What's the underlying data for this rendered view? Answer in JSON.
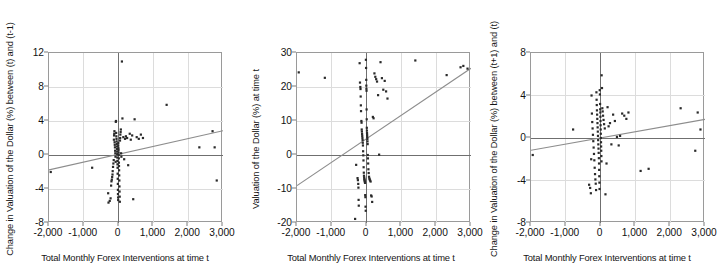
{
  "figure": {
    "width": 726,
    "height": 278,
    "background": "#ffffff",
    "axis_color": "#9a9a9a",
    "grid_color": "#dcdcdc",
    "point_color": "#2a2a2a",
    "trend_color": "#8d8d8d",
    "zero_line_color": "#6f6f6f"
  },
  "chart_data": [
    {
      "type": "scatter",
      "title": "",
      "xlabel": "Total Monthly Forex Interventions at time t",
      "ylabel": "Change in Valuation of the Dollar (%) between (t) and (t-1)",
      "xlim": [
        -2000,
        3000
      ],
      "ylim": [
        -8,
        12
      ],
      "xticks": [
        -2000,
        -1000,
        0,
        1000,
        2000,
        3000
      ],
      "xticklabels": [
        "-2,000",
        "-1,000",
        "0",
        "1,000",
        "2,000",
        "3,000"
      ],
      "yticks": [
        -8,
        -4,
        0,
        4,
        8,
        12
      ],
      "yticklabels": [
        "-8",
        "-4",
        "0",
        "4",
        "8",
        "12"
      ],
      "grid": true,
      "legend": "none",
      "trendline": {
        "x0": -2000,
        "y0": -1.75,
        "x1": 3000,
        "y1": 2.85
      },
      "zero_line_y": 0,
      "zero_line_x": 0,
      "points": [
        [
          -1950,
          -2.0
        ],
        [
          -760,
          -1.5
        ],
        [
          -300,
          -4.5
        ],
        [
          -290,
          -5.6
        ],
        [
          -255,
          -5.4
        ],
        [
          -230,
          -5.1
        ],
        [
          -215,
          -3.6
        ],
        [
          -205,
          -3.1
        ],
        [
          -195,
          -2.9
        ],
        [
          -185,
          -2.6
        ],
        [
          -175,
          -2.3
        ],
        [
          -170,
          -1.9
        ],
        [
          -160,
          -1.4
        ],
        [
          -150,
          -1.0
        ],
        [
          -140,
          -0.6
        ],
        [
          -135,
          1.8
        ],
        [
          -130,
          2.3
        ],
        [
          -125,
          2.5
        ],
        [
          -120,
          2.8
        ],
        [
          -115,
          1.5
        ],
        [
          -110,
          1.2
        ],
        [
          -105,
          0.9
        ],
        [
          -100,
          0.5
        ],
        [
          -95,
          0.2
        ],
        [
          -90,
          -0.2
        ],
        [
          -85,
          -0.8
        ],
        [
          -80,
          3.9
        ],
        [
          -75,
          4.0
        ],
        [
          -70,
          2.6
        ],
        [
          -65,
          2.2
        ],
        [
          -60,
          1.9
        ],
        [
          -55,
          1.6
        ],
        [
          -52,
          1.3
        ],
        [
          -48,
          1.0
        ],
        [
          -45,
          0.7
        ],
        [
          -42,
          0.4
        ],
        [
          -40,
          0.1
        ],
        [
          -38,
          -0.3
        ],
        [
          -35,
          -0.7
        ],
        [
          -32,
          -1.1
        ],
        [
          -30,
          -1.5
        ],
        [
          -28,
          -2.2
        ],
        [
          -25,
          -2.8
        ],
        [
          -22,
          -3.4
        ],
        [
          -20,
          -4.1
        ],
        [
          -18,
          -4.6
        ],
        [
          -15,
          -5.0
        ],
        [
          -12,
          -5.3
        ],
        [
          -10,
          1.1
        ],
        [
          -8,
          1.4
        ],
        [
          -5,
          0.8
        ],
        [
          -2,
          0.6
        ],
        [
          0,
          0.3
        ],
        [
          3,
          0.0
        ],
        [
          6,
          -0.4
        ],
        [
          9,
          -0.9
        ],
        [
          12,
          -1.3
        ],
        [
          15,
          -1.8
        ],
        [
          18,
          -2.4
        ],
        [
          22,
          -3.0
        ],
        [
          25,
          -3.7
        ],
        [
          28,
          -4.3
        ],
        [
          32,
          -4.9
        ],
        [
          36,
          -5.5
        ],
        [
          40,
          1.7
        ],
        [
          45,
          2.0
        ],
        [
          50,
          2.4
        ],
        [
          58,
          2.7
        ],
        [
          65,
          3.0
        ],
        [
          72,
          0.2
        ],
        [
          80,
          -0.2
        ],
        [
          95,
          11.0
        ],
        [
          110,
          4.3
        ],
        [
          135,
          2.1
        ],
        [
          160,
          -0.5
        ],
        [
          185,
          1.9
        ],
        [
          210,
          2.2
        ],
        [
          245,
          2.0
        ],
        [
          275,
          -1.2
        ],
        [
          320,
          2.5
        ],
        [
          350,
          1.8
        ],
        [
          390,
          2.3
        ],
        [
          420,
          -5.2
        ],
        [
          460,
          4.2
        ],
        [
          520,
          2.1
        ],
        [
          580,
          1.9
        ],
        [
          640,
          2.4
        ],
        [
          700,
          2.0
        ],
        [
          1380,
          5.9
        ],
        [
          2320,
          0.9
        ],
        [
          2700,
          2.8
        ],
        [
          2760,
          0.9
        ],
        [
          2820,
          -3.0
        ]
      ]
    },
    {
      "type": "scatter",
      "title": "",
      "xlabel": "Total Monthly Forex Interventions at time t",
      "ylabel": "Valuation of the Dollar (%) at time t",
      "xlim": [
        -2000,
        3000
      ],
      "ylim": [
        -20,
        30
      ],
      "xticks": [
        -2000,
        -1000,
        0,
        1000,
        2000,
        3000
      ],
      "xticklabels": [
        "-2,000",
        "-1,000",
        "0",
        "1,000",
        "2,000",
        "3,000"
      ],
      "yticks": [
        -20,
        -10,
        0,
        10,
        20,
        30
      ],
      "yticklabels": [
        "-20",
        "-10",
        "0",
        "10",
        "20",
        "30"
      ],
      "grid": true,
      "legend": "none",
      "trendline": {
        "x0": -2000,
        "y0": -9.0,
        "x1": 3000,
        "y1": 25.5
      },
      "zero_line_y": 0,
      "zero_line_x": 0,
      "points": [
        [
          -1950,
          24.3
        ],
        [
          -1200,
          22.7
        ],
        [
          -330,
          -18.8
        ],
        [
          -300,
          -2.9
        ],
        [
          -260,
          -6.8
        ],
        [
          -250,
          -7.4
        ],
        [
          -240,
          -8.5
        ],
        [
          -235,
          -9.6
        ],
        [
          -230,
          -13.2
        ],
        [
          -225,
          -14.9
        ],
        [
          -200,
          27.0
        ],
        [
          -190,
          21.3
        ],
        [
          -180,
          20.0
        ],
        [
          -175,
          19.4
        ],
        [
          -170,
          17.2
        ],
        [
          -165,
          14.6
        ],
        [
          -160,
          12.9
        ],
        [
          -150,
          10.0
        ],
        [
          -145,
          9.5
        ],
        [
          -140,
          7.5
        ],
        [
          -135,
          6.9
        ],
        [
          -130,
          6.2
        ],
        [
          -125,
          5.6
        ],
        [
          -120,
          5.0
        ],
        [
          -115,
          4.4
        ],
        [
          -110,
          3.6
        ],
        [
          -105,
          2.8
        ],
        [
          -100,
          1.1
        ],
        [
          -95,
          -0.1
        ],
        [
          -90,
          -1.6
        ],
        [
          -85,
          -3.6
        ],
        [
          -80,
          -5.2
        ],
        [
          -75,
          -6.1
        ],
        [
          -70,
          -6.6
        ],
        [
          -65,
          -7.0
        ],
        [
          -60,
          -7.3
        ],
        [
          -55,
          -7.6
        ],
        [
          -50,
          -7.9
        ],
        [
          -45,
          -8.2
        ],
        [
          -40,
          -11.8
        ],
        [
          -35,
          -12.4
        ],
        [
          -30,
          -15.2
        ],
        [
          -25,
          -16.4
        ],
        [
          -20,
          28.0
        ],
        [
          -15,
          25.6
        ],
        [
          -10,
          22.1
        ],
        [
          -8,
          20.4
        ],
        [
          -5,
          19.5
        ],
        [
          -2,
          18.9
        ],
        [
          0,
          13.4
        ],
        [
          3,
          10.5
        ],
        [
          6,
          8.0
        ],
        [
          9,
          7.2
        ],
        [
          12,
          6.5
        ],
        [
          15,
          5.9
        ],
        [
          18,
          5.3
        ],
        [
          22,
          4.7
        ],
        [
          26,
          4.0
        ],
        [
          30,
          3.2
        ],
        [
          34,
          0.0
        ],
        [
          38,
          -1.0
        ],
        [
          45,
          -2.5
        ],
        [
          52,
          -4.2
        ],
        [
          60,
          -5.3
        ],
        [
          70,
          -6.4
        ],
        [
          80,
          -6.9
        ],
        [
          90,
          -7.2
        ],
        [
          100,
          -7.5
        ],
        [
          115,
          -7.8
        ],
        [
          130,
          -11.9
        ],
        [
          145,
          -12.2
        ],
        [
          160,
          -13.8
        ],
        [
          180,
          11.2
        ],
        [
          200,
          10.8
        ],
        [
          225,
          24.0
        ],
        [
          250,
          23.0
        ],
        [
          275,
          22.3
        ],
        [
          300,
          21.6
        ],
        [
          330,
          17.6
        ],
        [
          360,
          0.1
        ],
        [
          400,
          27.3
        ],
        [
          440,
          22.6
        ],
        [
          480,
          19.2
        ],
        [
          520,
          21.8
        ],
        [
          560,
          18.7
        ],
        [
          600,
          16.6
        ],
        [
          1400,
          27.8
        ],
        [
          2300,
          23.5
        ],
        [
          2700,
          25.8
        ],
        [
          2780,
          26.2
        ],
        [
          2900,
          25.4
        ]
      ]
    },
    {
      "type": "scatter",
      "title": "",
      "xlabel": "Total Monthly Forex Interventions at time t",
      "ylabel": "Change in Valuation of the Dollar (%) between (t+1) and (t)",
      "xlim": [
        -2000,
        3000
      ],
      "ylim": [
        -8,
        8
      ],
      "xticks": [
        -2000,
        -1000,
        0,
        1000,
        2000,
        3000
      ],
      "xticklabels": [
        "-2,000",
        "-1,000",
        "0",
        "1,000",
        "2,000",
        "3,000"
      ],
      "yticks": [
        -8,
        -4,
        0,
        4,
        8
      ],
      "yticklabels": [
        "-8",
        "-4",
        "0",
        "4",
        "8"
      ],
      "grid": true,
      "legend": "none",
      "trendline": {
        "x0": -2000,
        "y0": -1.15,
        "x1": 3000,
        "y1": 1.75
      },
      "zero_line_y": 0,
      "zero_line_x": 0,
      "points": [
        [
          -1950,
          -1.6
        ],
        [
          -790,
          0.8
        ],
        [
          -330,
          -4.4
        ],
        [
          -300,
          -4.7
        ],
        [
          -280,
          -5.2
        ],
        [
          -270,
          -2.0
        ],
        [
          -260,
          4.0
        ],
        [
          -250,
          2.3
        ],
        [
          -240,
          1.5
        ],
        [
          -230,
          0.9
        ],
        [
          -220,
          0.3
        ],
        [
          -210,
          -0.3
        ],
        [
          -200,
          -0.9
        ],
        [
          -190,
          -1.5
        ],
        [
          -180,
          -2.1
        ],
        [
          -170,
          -2.8
        ],
        [
          -160,
          -3.4
        ],
        [
          -150,
          -3.9
        ],
        [
          -140,
          -4.3
        ],
        [
          -130,
          -4.9
        ],
        [
          -120,
          4.3
        ],
        [
          -115,
          3.6
        ],
        [
          -110,
          3.1
        ],
        [
          -105,
          2.6
        ],
        [
          -100,
          2.2
        ],
        [
          -95,
          1.8
        ],
        [
          -90,
          1.4
        ],
        [
          -85,
          1.0
        ],
        [
          -80,
          0.6
        ],
        [
          -75,
          0.2
        ],
        [
          -70,
          -0.2
        ],
        [
          -65,
          -0.6
        ],
        [
          -60,
          -1.0
        ],
        [
          -55,
          -1.4
        ],
        [
          -50,
          -1.9
        ],
        [
          -45,
          -2.4
        ],
        [
          -42,
          -3.0
        ],
        [
          -38,
          -3.6
        ],
        [
          -34,
          -4.2
        ],
        [
          -30,
          -4.8
        ],
        [
          -25,
          4.5
        ],
        [
          -20,
          4.1
        ],
        [
          -15,
          3.2
        ],
        [
          -12,
          2.7
        ],
        [
          -9,
          2.4
        ],
        [
          -6,
          2.0
        ],
        [
          -3,
          1.6
        ],
        [
          0,
          1.2
        ],
        [
          3,
          0.8
        ],
        [
          6,
          0.4
        ],
        [
          9,
          0.0
        ],
        [
          12,
          -0.4
        ],
        [
          15,
          -0.8
        ],
        [
          18,
          -1.2
        ],
        [
          22,
          -1.7
        ],
        [
          26,
          -2.2
        ],
        [
          30,
          5.9
        ],
        [
          40,
          4.7
        ],
        [
          50,
          2.8
        ],
        [
          60,
          2.5
        ],
        [
          70,
          2.1
        ],
        [
          85,
          1.7
        ],
        [
          100,
          1.3
        ],
        [
          120,
          0.9
        ],
        [
          140,
          -5.3
        ],
        [
          170,
          -2.4
        ],
        [
          200,
          2.9
        ],
        [
          230,
          1.1
        ],
        [
          270,
          1.4
        ],
        [
          310,
          -0.6
        ],
        [
          360,
          2.2
        ],
        [
          410,
          1.6
        ],
        [
          470,
          0.1
        ],
        [
          520,
          -0.7
        ],
        [
          560,
          0.2
        ],
        [
          620,
          2.3
        ],
        [
          680,
          2.1
        ],
        [
          740,
          1.8
        ],
        [
          800,
          2.4
        ],
        [
          1380,
          -2.9
        ],
        [
          1150,
          -3.1
        ],
        [
          2300,
          2.8
        ],
        [
          2720,
          -1.2
        ],
        [
          2790,
          2.4
        ],
        [
          2870,
          0.8
        ]
      ]
    }
  ]
}
